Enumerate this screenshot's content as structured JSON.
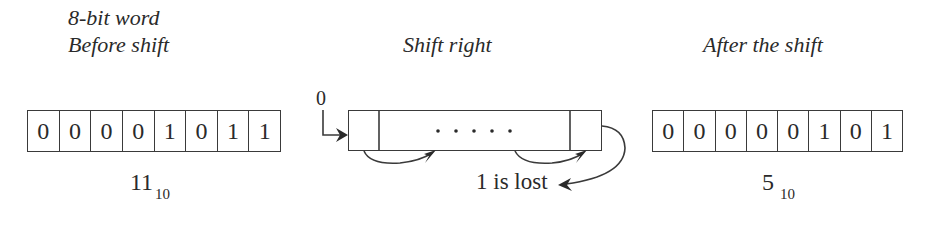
{
  "before": {
    "caption_line1": "8-bit word",
    "caption_line2": "Before shift",
    "bits": [
      "0",
      "0",
      "0",
      "0",
      "1",
      "0",
      "1",
      "1"
    ],
    "value": "11",
    "base": "10"
  },
  "shift": {
    "caption": "Shift right",
    "input_bit": "0",
    "ellipsis": ". . . . .",
    "lost_label": "1 is lost"
  },
  "after": {
    "caption": "After the shift",
    "bits": [
      "0",
      "0",
      "0",
      "0",
      "0",
      "1",
      "0",
      "1"
    ],
    "value": "5",
    "base": "10"
  }
}
